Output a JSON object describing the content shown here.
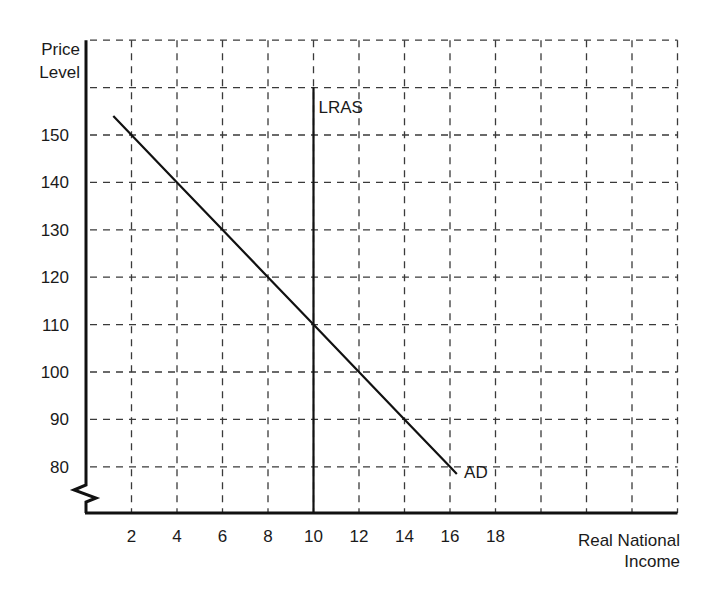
{
  "chart_data": {
    "type": "line",
    "title": "",
    "ylabel": "Price Level",
    "xlabel": "Real National Income",
    "xlim": [
      0,
      26
    ],
    "ylim": [
      70,
      170
    ],
    "y_axis_break": true,
    "grid": true,
    "grid_style": "dashed",
    "x_grid": [
      2,
      4,
      6,
      8,
      10,
      12,
      14,
      16,
      18,
      20,
      22,
      24,
      26
    ],
    "y_grid": [
      80,
      90,
      100,
      110,
      120,
      130,
      140,
      150,
      160,
      170
    ],
    "x_ticks": [
      2,
      4,
      6,
      8,
      10,
      12,
      14,
      16,
      18
    ],
    "y_ticks": [
      80,
      90,
      100,
      110,
      120,
      130,
      140,
      150
    ],
    "series": [
      {
        "name": "AD",
        "label": "AD",
        "points": [
          [
            1.2,
            154
          ],
          [
            2,
            150
          ],
          [
            4,
            140
          ],
          [
            6,
            130
          ],
          [
            8,
            120
          ],
          [
            10,
            110
          ],
          [
            12,
            100
          ],
          [
            14,
            90
          ],
          [
            16,
            80
          ],
          [
            16.3,
            78.5
          ]
        ]
      },
      {
        "name": "LRAS",
        "label": "LRAS",
        "points": [
          [
            10,
            70
          ],
          [
            10,
            160
          ]
        ]
      }
    ],
    "annotations": [
      {
        "text": "LRAS",
        "x": 10,
        "y": 156
      },
      {
        "text": "AD",
        "x": 16.4,
        "y": 79
      }
    ],
    "equilibrium": {
      "x": 10,
      "y": 110
    }
  },
  "labels": {
    "y_title_line1": "Price",
    "y_title_line2": "Level",
    "x_title_line1": "Real National",
    "x_title_line2": "Income"
  }
}
